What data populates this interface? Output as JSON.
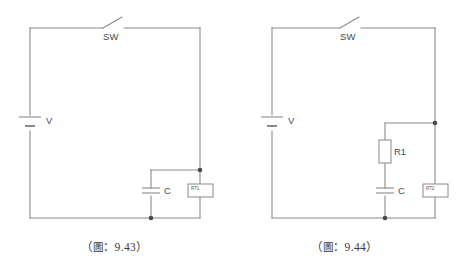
{
  "page": {
    "background_color": "#ffffff",
    "line_color": "#8a8a8a",
    "text_color": "#4a4a4a"
  },
  "figures": [
    {
      "id": "9.43",
      "caption_open": "（",
      "caption_cjk": "圖",
      "caption_sep": "：",
      "caption_number": "9.43",
      "caption_close": "）",
      "components": {
        "switch_label": "SW",
        "battery_label": "V",
        "capacitor_label": "C",
        "thermistor_label": "RT1"
      }
    },
    {
      "id": "9.44",
      "caption_open": "（",
      "caption_cjk": "圖",
      "caption_sep": "：",
      "caption_number": "9.44",
      "caption_close": "）",
      "components": {
        "switch_label": "SW",
        "battery_label": "V",
        "resistor_label": "R1",
        "capacitor_label": "C",
        "thermistor_label": "RT2"
      }
    }
  ]
}
